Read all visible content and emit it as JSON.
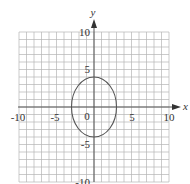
{
  "chart_data": {
    "type": "line",
    "title": "",
    "xlabel": "x",
    "ylabel": "y",
    "xlim": [
      -10,
      10
    ],
    "ylim": [
      -10,
      10
    ],
    "grid": true,
    "grid_step": 1,
    "x_ticks": [
      "-10",
      "-5",
      "0",
      "5",
      "10"
    ],
    "y_ticks": [
      "10",
      "5",
      "-5",
      "-10"
    ],
    "origin_label": "0",
    "series": [
      {
        "name": "ellipse",
        "shape": "ellipse",
        "center": [
          0,
          0
        ],
        "semi_axis_x": 3,
        "semi_axis_y": 4,
        "equation": "x^2/9 + y^2/16 = 1"
      }
    ]
  },
  "labels": {
    "x_axis": "x",
    "y_axis": "y",
    "x_neg10": "-10",
    "x_neg5": "-5",
    "origin": "0",
    "x_5": "5",
    "x_10": "10",
    "y_10": "10",
    "y_5": "5",
    "y_neg5": "-5",
    "y_neg10": "-10"
  },
  "colors": {
    "grid": "#b5b5b5",
    "axis": "#555555",
    "curve": "#555555"
  }
}
